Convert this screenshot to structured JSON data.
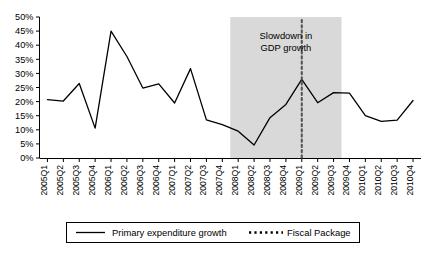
{
  "chart_data": {
    "type": "line",
    "title": "",
    "xlabel": "",
    "ylabel": "",
    "ylim": [
      0,
      50
    ],
    "ytick_labels": [
      "0%",
      "5%",
      "10%",
      "15%",
      "20%",
      "25%",
      "30%",
      "35%",
      "40%",
      "45%",
      "50%"
    ],
    "ytick_values": [
      0,
      5,
      10,
      15,
      20,
      25,
      30,
      35,
      40,
      45,
      50
    ],
    "grid": false,
    "legend_position": "bottom",
    "categories": [
      "2005Q1",
      "2005Q2",
      "2005Q3",
      "2005Q4",
      "2006Q1",
      "2006Q2",
      "2006Q3",
      "2006Q4",
      "2007Q1",
      "2007Q2",
      "2007Q3",
      "2007Q4",
      "2008Q1",
      "2008Q2",
      "2008Q3",
      "2008Q4",
      "2009Q1",
      "2009Q2",
      "2009Q3",
      "2009Q4",
      "2010Q1",
      "2010Q2",
      "2010Q3",
      "2010Q4"
    ],
    "series": [
      {
        "name": "Primary expenditure growth",
        "style": "solid",
        "color": "#000000",
        "values": [
          20.7,
          20.2,
          26.4,
          10.6,
          45.0,
          36.0,
          24.8,
          26.3,
          19.5,
          31.7,
          13.5,
          11.8,
          9.5,
          4.6,
          14.3,
          19.0,
          27.9,
          19.6,
          23.2,
          23.0,
          15.0,
          13.0,
          13.4,
          20.4
        ]
      }
    ],
    "vertical_marker": {
      "name": "Fiscal Package",
      "style": "dotted",
      "color": "#555555",
      "at_category": "2009Q1"
    },
    "shaded_region": {
      "label_line1": "Slowdown in",
      "label_line2": "GDP growth",
      "from_category": "2008Q1",
      "to_category": "2009Q3",
      "color": "#d9d9d9"
    },
    "legend": [
      {
        "label": "Primary expenditure growth",
        "style": "solid",
        "color": "#000000"
      },
      {
        "label": "Fiscal Package",
        "style": "dotted",
        "color": "#000000"
      }
    ]
  }
}
